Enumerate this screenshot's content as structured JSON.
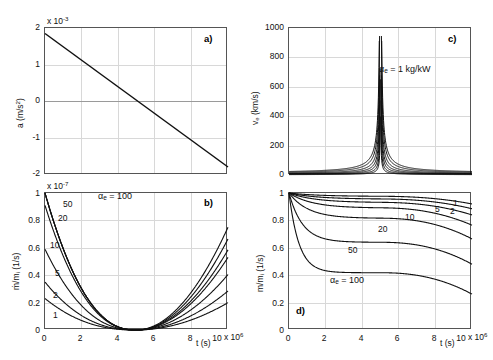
{
  "figure": {
    "panel_labels": {
      "a": "a)",
      "b": "b)",
      "c": "c)",
      "d": "d)"
    }
  },
  "chart_data": [
    {
      "type": "line",
      "panel": "a",
      "title": "",
      "xlabel": "t (s)",
      "ylabel": "a (m/s²)",
      "x_exponent": "x 10⁶",
      "y_exponent": "x 10⁻³",
      "xlim": [
        0,
        10
      ],
      "ylim": [
        -2,
        2
      ],
      "xticks": [
        0,
        2,
        4,
        6,
        8,
        10
      ],
      "xticklabels": [
        "0",
        "2",
        "4",
        "6",
        "8",
        "10"
      ],
      "yticks": [
        -2,
        -1,
        0,
        1,
        2
      ],
      "yticklabels": [
        "-2",
        "-1",
        "0",
        "1",
        "2"
      ],
      "grid": true,
      "legend": "none",
      "series": [
        {
          "name": "acceleration",
          "x": [
            0,
            10
          ],
          "values": [
            1.85,
            -1.8
          ]
        }
      ]
    },
    {
      "type": "line",
      "panel": "c",
      "title": "",
      "xlabel": "t (s)",
      "ylabel": "v_e (km/s)",
      "x_exponent": "x 10⁶",
      "y_exponent": "",
      "xlim": [
        0,
        10
      ],
      "ylim": [
        0,
        1000
      ],
      "xticks": [
        0,
        2,
        4,
        6,
        8,
        10
      ],
      "xticklabels": [
        "0",
        "2",
        "4",
        "6",
        "8",
        "10"
      ],
      "yticks": [
        0,
        200,
        400,
        600,
        800,
        1000
      ],
      "yticklabels": [
        "0",
        "200",
        "400",
        "600",
        "800",
        "1000"
      ],
      "grid": true,
      "legend": "none",
      "annotation": "αₑ = 1 kg/kW",
      "asymptote_t": 5.0,
      "series": [
        {
          "name": "1",
          "scale": 1.0
        },
        {
          "name": "2",
          "scale": 0.78
        },
        {
          "name": "5",
          "scale": 0.56
        },
        {
          "name": "10",
          "scale": 0.4
        },
        {
          "name": "20",
          "scale": 0.28
        },
        {
          "name": "50",
          "scale": 0.18
        },
        {
          "name": "100",
          "scale": 0.11
        }
      ]
    },
    {
      "type": "line",
      "panel": "b",
      "title": "",
      "xlabel": "t (s)",
      "ylabel": "ṁ/mᵢ (1/s)",
      "x_exponent": "x 10⁶",
      "y_exponent": "x 10⁻⁷",
      "xlim": [
        0,
        10
      ],
      "ylim": [
        0,
        1
      ],
      "xticks": [
        0,
        2,
        4,
        6,
        8,
        10
      ],
      "xticklabels": [
        "0",
        "2",
        "4",
        "6",
        "8",
        "10"
      ],
      "yticks": [
        0,
        0.2,
        0.4,
        0.6,
        0.8,
        1
      ],
      "yticklabels": [
        "0",
        "0.2",
        "0.4",
        "0.6",
        "0.8",
        "1"
      ],
      "grid": true,
      "legend": "inline-curve-labels",
      "annotation": "αₑ = 100",
      "curve_labels": [
        "1",
        "2",
        "5",
        "10",
        "20",
        "50"
      ],
      "minimum_t": 5.0,
      "series": [
        {
          "name": "1",
          "y_start": 0.23,
          "y_end": 0.2
        },
        {
          "name": "2",
          "y_start": 0.35,
          "y_end": 0.285
        },
        {
          "name": "5",
          "y_start": 0.59,
          "y_end": 0.405
        },
        {
          "name": "10",
          "y_start": 0.91,
          "y_end": 0.53
        },
        {
          "name": "20",
          "y_start": 1.0,
          "y_end": 0.585
        },
        {
          "name": "50",
          "y_start": 1.0,
          "y_end": 0.665
        },
        {
          "name": "100",
          "y_start": 1.0,
          "y_end": 0.75
        }
      ]
    },
    {
      "type": "line",
      "panel": "d",
      "title": "",
      "xlabel": "t (s)",
      "ylabel": "m/mᵢ (1/s)",
      "x_exponent": "x 10⁶",
      "y_exponent": "",
      "xlim": [
        0,
        10
      ],
      "ylim": [
        0,
        1
      ],
      "xticks": [
        0,
        2,
        4,
        6,
        8,
        10
      ],
      "xticklabels": [
        "0",
        "2",
        "4",
        "6",
        "8",
        "10"
      ],
      "yticks": [
        0,
        0.2,
        0.4,
        0.6,
        0.8,
        1
      ],
      "yticklabels": [
        "0",
        "0.2",
        "0.4",
        "0.6",
        "0.8",
        "1"
      ],
      "grid": true,
      "legend": "inline-curve-labels",
      "annotation": "αₑ = 100",
      "curve_labels": [
        "1",
        "2",
        "5",
        "10",
        "20",
        "50"
      ],
      "series": [
        {
          "name": "1",
          "plateau": 0.975,
          "y_end": 0.92
        },
        {
          "name": "2",
          "plateau": 0.955,
          "y_end": 0.885
        },
        {
          "name": "5",
          "plateau": 0.93,
          "y_end": 0.84
        },
        {
          "name": "10",
          "plateau": 0.89,
          "y_end": 0.765
        },
        {
          "name": "20",
          "plateau": 0.815,
          "y_end": 0.665
        },
        {
          "name": "50",
          "plateau": 0.64,
          "y_end": 0.48
        },
        {
          "name": "100",
          "plateau": 0.418,
          "y_end": 0.262
        }
      ]
    }
  ],
  "panels": {
    "a": {
      "label": "a)",
      "y_exponent": "x 10",
      "y_exponent_sup": "-3",
      "yticklabels": [
        "2",
        "1",
        "0",
        "-1",
        "-2"
      ],
      "xticklabels": [
        "0",
        "2",
        "4",
        "6",
        "8",
        "10"
      ],
      "ylabel_main": "a (m/s",
      "ylabel_sup": "2",
      "ylabel_tail": ")"
    },
    "b": {
      "label": "b)",
      "y_exponent": "x 10",
      "y_exponent_sup": "-7",
      "yticklabels": [
        "1",
        "0.8",
        "0.6",
        "0.4",
        "0.2",
        "0"
      ],
      "xticklabels": [
        "0",
        "2",
        "4",
        "6",
        "8",
        "10"
      ],
      "xlabel": "t (s)",
      "x_exponent": "x 10",
      "x_exponent_sup": "6",
      "ylabel": "ṁ/m",
      "ylabel_sub": "i",
      "ylabel_tail": " (1/s)",
      "annotation_alpha": "α",
      "annotation_sub": "e",
      "annotation_rest": " = 100",
      "curve_labels": [
        "50",
        "20",
        "10",
        "5",
        "2",
        "1"
      ]
    },
    "c": {
      "label": "c)",
      "yticklabels": [
        "1000",
        "800",
        "600",
        "400",
        "200",
        "0"
      ],
      "xticklabels": [
        "0",
        "2",
        "4",
        "6",
        "8",
        "10"
      ],
      "ylabel": "v",
      "ylabel_sub": "e",
      "ylabel_tail": " (km/s)",
      "annotation_alpha": "α",
      "annotation_sub": "e",
      "annotation_rest": " = 1 kg/kW"
    },
    "d": {
      "label": "d)",
      "yticklabels": [
        "1",
        "0.8",
        "0.6",
        "0.4",
        "0.2",
        "0"
      ],
      "xticklabels": [
        "0",
        "2",
        "4",
        "6",
        "8",
        "10"
      ],
      "xlabel": "t (s)",
      "x_exponent": "x 10",
      "x_exponent_sup": "6",
      "ylabel": "m/m",
      "ylabel_sub": "i",
      "ylabel_tail": " (1/s)",
      "annotation_alpha": "α",
      "annotation_sub": "e",
      "annotation_rest": " = 100",
      "curve_labels": [
        "1",
        "2",
        "5",
        "10",
        "20",
        "50"
      ]
    }
  }
}
